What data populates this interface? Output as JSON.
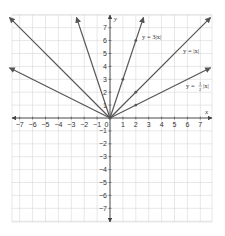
{
  "chart_data": {
    "type": "line",
    "title": "",
    "xlabel": "x",
    "ylabel": "y",
    "xlim": [
      -7.6,
      7.9
    ],
    "ylim": [
      -8,
      7.9
    ],
    "grid": true,
    "x_ticks": [
      -7,
      -6,
      -5,
      -4,
      -3,
      -2,
      -1,
      0,
      1,
      2,
      3,
      4,
      5,
      6,
      7
    ],
    "y_ticks": [
      -7,
      -6,
      -5,
      -4,
      -3,
      -2,
      -1,
      1,
      2,
      3,
      4,
      5,
      6,
      7
    ],
    "x_tick_labels": [
      "−7",
      "−6",
      "−5",
      "−4",
      "−3",
      "−2",
      "−1",
      "0",
      "1",
      "2",
      "3",
      "4",
      "5",
      "6",
      "7"
    ],
    "y_tick_labels": [
      "−7",
      "−6",
      "−5",
      "−4",
      "−3",
      "−2",
      "−1",
      "1",
      "2",
      "3",
      "4",
      "5",
      "6",
      "7"
    ],
    "series": [
      {
        "name": "y = 3|x|",
        "label": "y = 3|x|",
        "x": [
          -2.6,
          0,
          2.6
        ],
        "y": [
          7.8,
          0,
          7.8
        ],
        "marked_points": [
          [
            1,
            3
          ],
          [
            2,
            6
          ]
        ]
      },
      {
        "name": "y = |x|",
        "label": "y = |x|",
        "x": [
          -7.8,
          0,
          7.8
        ],
        "y": [
          7.8,
          0,
          7.8
        ],
        "marked_points": [
          [
            2,
            2
          ]
        ]
      },
      {
        "name": "y = ½|x|",
        "label": "y = ½|x|",
        "x": [
          -7.8,
          0,
          7.8
        ],
        "y": [
          3.9,
          0,
          3.9
        ],
        "marked_points": [
          [
            2,
            1
          ]
        ]
      }
    ],
    "annotations": [
      {
        "text": "y = 3|x|",
        "at": [
          2.6,
          6.6
        ]
      },
      {
        "text": "y = |x|",
        "at": [
          5.8,
          5.1
        ]
      },
      {
        "text": "y = ½|x|",
        "at": [
          5.8,
          2.2
        ]
      }
    ],
    "legend": "none (inline labels)"
  },
  "labels": {
    "x_axis": "x",
    "y_axis": "y",
    "eq1": "y = 3|x|",
    "eq2": "y = |x|",
    "eq3_prefix": "y = ",
    "eq3_num": "1",
    "eq3_den": "2",
    "eq3_suffix": "|x|"
  },
  "colors": {
    "line": "#555555",
    "grid": "#d6d6d6",
    "axis": "#444444"
  }
}
